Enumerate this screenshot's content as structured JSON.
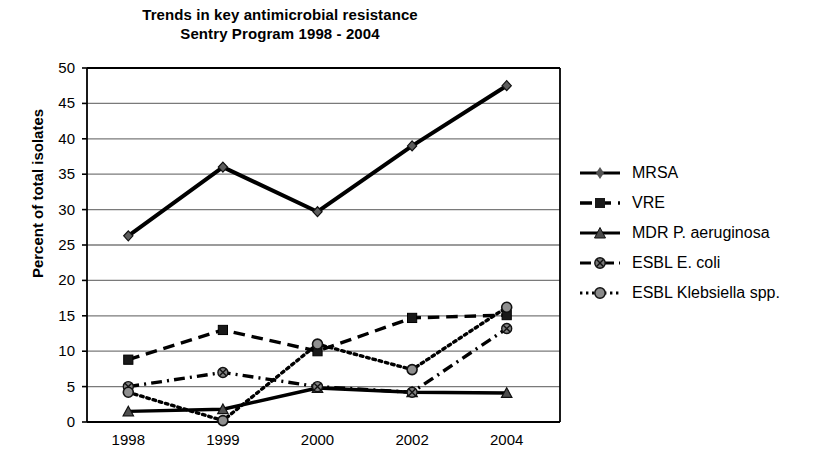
{
  "chart_data": {
    "type": "line",
    "title": "Trends in key antimicrobial resistance\nSentry Program 1998 - 2004",
    "title_line1": "Trends in key antimicrobial resistance",
    "title_line2": "Sentry Program 1998 - 2004",
    "xlabel": "",
    "ylabel": "Percent of total isolates",
    "categories": [
      "1998",
      "1999",
      "2000",
      "2002",
      "2004"
    ],
    "x": [
      1998,
      1999,
      2000,
      2002,
      2004
    ],
    "ylim": [
      0,
      50
    ],
    "yticks": [
      0,
      5,
      10,
      15,
      20,
      25,
      30,
      35,
      40,
      45,
      50
    ],
    "grid": "horizontal",
    "legend_position": "right",
    "series": [
      {
        "name": "MRSA",
        "values": [
          26.3,
          36.0,
          29.7,
          39.0,
          47.5
        ],
        "line_style": "solid",
        "marker": "diamond",
        "color": "#000000"
      },
      {
        "name": "VRE",
        "values": [
          8.8,
          13.0,
          10.0,
          14.7,
          15.1
        ],
        "line_style": "dashed",
        "marker": "square",
        "color": "#000000"
      },
      {
        "name": "MDR P. aeruginosa",
        "values": [
          1.5,
          1.8,
          4.8,
          4.2,
          4.1
        ],
        "line_style": "solid",
        "marker": "triangle",
        "color": "#000000"
      },
      {
        "name": "ESBL E. coli",
        "values": [
          5.0,
          7.0,
          5.0,
          4.2,
          13.2
        ],
        "line_style": "dash-dot",
        "marker": "circle-x",
        "color": "#000000"
      },
      {
        "name": "ESBL Klebsiella spp.",
        "values": [
          4.2,
          0.2,
          11.0,
          7.4,
          16.2
        ],
        "line_style": "dotted",
        "marker": "circle",
        "color": "#000000"
      }
    ]
  },
  "legend": {
    "items": [
      {
        "label": "MRSA"
      },
      {
        "label": "VRE"
      },
      {
        "label": "MDR P. aeruginosa"
      },
      {
        "label": "ESBL E. coli"
      },
      {
        "label": "ESBL Klebsiella spp."
      }
    ]
  },
  "colors": {
    "plot_line": "#000000",
    "gridline": "#7a7a7a",
    "axis": "#000000",
    "background": "#ffffff"
  }
}
